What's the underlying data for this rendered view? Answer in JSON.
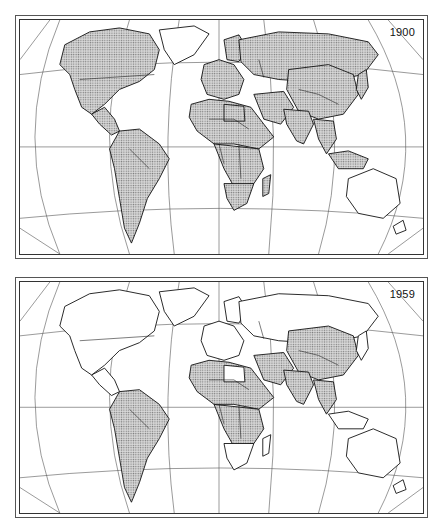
{
  "figure": {
    "panels": [
      {
        "year_label": "1900",
        "shaded": {
          "north_america": true,
          "greenland": false,
          "central_america": true,
          "south_america": true,
          "europe_west": true,
          "scandinavia": true,
          "russia": true,
          "africa_north": true,
          "africa_libya": true,
          "africa_sub": true,
          "africa_south": true,
          "madagascar": true,
          "middle_east": true,
          "china": true,
          "india": true,
          "southeast_asia": true,
          "indonesia": true,
          "australia": false,
          "new_zealand": false,
          "japan": true
        }
      },
      {
        "year_label": "1959",
        "shaded": {
          "north_america": false,
          "greenland": false,
          "central_america": false,
          "south_america": true,
          "europe_west": false,
          "scandinavia": false,
          "russia": false,
          "africa_north": true,
          "africa_libya": false,
          "africa_sub": true,
          "africa_south": false,
          "madagascar": false,
          "middle_east": true,
          "china": true,
          "india": true,
          "southeast_asia": true,
          "indonesia": false,
          "australia": false,
          "new_zealand": false,
          "japan": false
        }
      }
    ],
    "colors": {
      "shade_dot": "#7a7a7a",
      "shade_bg": "#d9d9d9",
      "outline": "#111111",
      "unshaded": "#ffffff"
    }
  }
}
